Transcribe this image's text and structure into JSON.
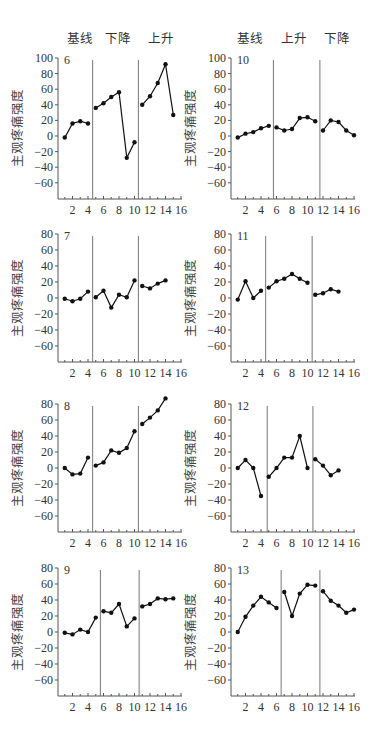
{
  "figure": {
    "left_phase_headers": [
      "基线",
      "下降",
      "上升"
    ],
    "right_phase_headers": [
      "基线",
      "上升",
      "下降"
    ],
    "y_axis_label": "主观疼痛强度",
    "x_tick_labels": [
      "2",
      "4",
      "6",
      "8",
      "10",
      "12",
      "14",
      "16"
    ]
  },
  "chart_data": [
    {
      "type": "line",
      "panel": "6",
      "column": "left",
      "row": 0,
      "title": "6",
      "ylabel": "主观疼痛强度",
      "xlabel": "",
      "phases": [
        "基线",
        "下降",
        "上升"
      ],
      "phase_change_x": [
        4.6,
        10.5
      ],
      "ylim": [
        -60,
        100
      ],
      "yticks": [
        100,
        80,
        60,
        40,
        20,
        0,
        -20,
        -40,
        -60
      ],
      "xlim": [
        0,
        16
      ],
      "xticks": [
        2,
        4,
        6,
        8,
        10,
        12,
        14,
        16
      ],
      "grid": false,
      "segments": [
        {
          "x": [
            1,
            2,
            3,
            4
          ],
          "y": [
            -2,
            16,
            19,
            16
          ]
        },
        {
          "x": [
            5,
            6,
            7,
            8,
            9,
            10
          ],
          "y": [
            36,
            42,
            50,
            56,
            -28,
            -8
          ]
        },
        {
          "x": [
            11,
            12,
            13,
            14,
            15
          ],
          "y": [
            40,
            51,
            68,
            92,
            27
          ]
        }
      ]
    },
    {
      "type": "line",
      "panel": "10",
      "column": "right",
      "row": 0,
      "title": "10",
      "ylabel": "主观疼痛强度",
      "xlabel": "",
      "phases": [
        "基线",
        "上升",
        "下降"
      ],
      "phase_change_x": [
        5.6,
        11.6
      ],
      "ylim": [
        -60,
        100
      ],
      "yticks": [
        100,
        80,
        60,
        40,
        20,
        0,
        -20,
        -40,
        -60
      ],
      "xlim": [
        0,
        16
      ],
      "xticks": [
        2,
        4,
        6,
        8,
        10,
        12,
        14,
        16
      ],
      "grid": false,
      "segments": [
        {
          "x": [
            1,
            2,
            3,
            4,
            5
          ],
          "y": [
            -2,
            3,
            5,
            10,
            13
          ]
        },
        {
          "x": [
            6,
            7,
            8,
            9,
            10,
            11
          ],
          "y": [
            11,
            7,
            9,
            23,
            24,
            19
          ]
        },
        {
          "x": [
            12,
            13,
            14,
            15,
            16
          ],
          "y": [
            7,
            20,
            18,
            7,
            1
          ]
        }
      ]
    },
    {
      "type": "line",
      "panel": "7",
      "column": "left",
      "row": 1,
      "title": "7",
      "ylabel": "主观疼痛强度",
      "xlabel": "",
      "phases": [
        "基线",
        "下降",
        "上升"
      ],
      "phase_change_x": [
        4.6,
        10.5
      ],
      "ylim": [
        -80,
        80
      ],
      "yticks": [
        80,
        60,
        40,
        20,
        0,
        -20,
        -40,
        -60
      ],
      "xlim": [
        0,
        16
      ],
      "xticks": [
        2,
        4,
        6,
        8,
        10,
        12,
        14,
        16
      ],
      "grid": false,
      "segments": [
        {
          "x": [
            1,
            2,
            3,
            4
          ],
          "y": [
            -1,
            -4,
            -1,
            8
          ]
        },
        {
          "x": [
            5,
            6,
            7,
            8,
            9,
            10
          ],
          "y": [
            1,
            9,
            -12,
            4,
            1,
            22
          ]
        },
        {
          "x": [
            11,
            12,
            13,
            14
          ],
          "y": [
            15,
            12,
            18,
            22
          ]
        }
      ]
    },
    {
      "type": "line",
      "panel": "11",
      "column": "right",
      "row": 1,
      "title": "11",
      "ylabel": "主观疼痛强度",
      "xlabel": "",
      "phases": [
        "基线",
        "上升",
        "下降"
      ],
      "phase_change_x": [
        4.6,
        10.6
      ],
      "ylim": [
        -80,
        80
      ],
      "yticks": [
        80,
        60,
        40,
        20,
        0,
        -20,
        -40,
        -60
      ],
      "xlim": [
        0,
        16
      ],
      "xticks": [
        2,
        4,
        6,
        8,
        10,
        12,
        14,
        16
      ],
      "grid": false,
      "segments": [
        {
          "x": [
            1,
            2,
            3,
            4
          ],
          "y": [
            -2,
            21,
            0,
            9
          ]
        },
        {
          "x": [
            5,
            6,
            7,
            8,
            9,
            10
          ],
          "y": [
            13,
            21,
            24,
            30,
            24,
            19
          ]
        },
        {
          "x": [
            11,
            12,
            13,
            14
          ],
          "y": [
            4,
            6,
            11,
            8
          ]
        }
      ]
    },
    {
      "type": "line",
      "panel": "8",
      "column": "left",
      "row": 2,
      "title": "8",
      "ylabel": "主观疼痛强度",
      "xlabel": "",
      "phases": [
        "基线",
        "下降",
        "上升"
      ],
      "phase_change_x": [
        4.6,
        10.5
      ],
      "ylim": [
        -80,
        80
      ],
      "yticks": [
        80,
        60,
        40,
        20,
        0,
        -20,
        -40,
        -60
      ],
      "xlim": [
        0,
        16
      ],
      "xticks": [
        2,
        4,
        6,
        8,
        10,
        12,
        14,
        16
      ],
      "grid": false,
      "segments": [
        {
          "x": [
            1,
            2,
            3,
            4
          ],
          "y": [
            0,
            -8,
            -7,
            13
          ]
        },
        {
          "x": [
            5,
            6,
            7,
            8,
            9,
            10
          ],
          "y": [
            3,
            7,
            22,
            19,
            25,
            46
          ]
        },
        {
          "x": [
            11,
            12,
            13,
            14
          ],
          "y": [
            55,
            63,
            72,
            87
          ]
        }
      ]
    },
    {
      "type": "line",
      "panel": "12",
      "column": "right",
      "row": 2,
      "title": "12",
      "ylabel": "主观疼痛强度",
      "xlabel": "",
      "phases": [
        "基线",
        "上升",
        "下降"
      ],
      "phase_change_x": [
        4.8,
        10.7
      ],
      "ylim": [
        -80,
        80
      ],
      "yticks": [
        80,
        60,
        40,
        20,
        0,
        -20,
        -40,
        -60
      ],
      "xlim": [
        0,
        16
      ],
      "xticks": [
        2,
        4,
        6,
        8,
        10,
        12,
        14,
        16
      ],
      "grid": false,
      "segments": [
        {
          "x": [
            1,
            2,
            3,
            4
          ],
          "y": [
            0,
            10,
            0,
            -35
          ]
        },
        {
          "x": [
            5,
            6,
            7,
            8,
            9,
            10
          ],
          "y": [
            -11,
            0,
            13,
            13,
            40,
            0
          ]
        },
        {
          "x": [
            11,
            12,
            13,
            14
          ],
          "y": [
            11,
            3,
            -9,
            -3
          ]
        }
      ]
    },
    {
      "type": "line",
      "panel": "9",
      "column": "left",
      "row": 3,
      "title": "9",
      "ylabel": "主观疼痛强度",
      "xlabel": "",
      "phases": [
        "基线",
        "下降",
        "上升"
      ],
      "phase_change_x": [
        5.6,
        10.6
      ],
      "ylim": [
        -80,
        80
      ],
      "yticks": [
        80,
        60,
        40,
        20,
        0,
        -20,
        -40,
        -60
      ],
      "xlim": [
        0,
        16
      ],
      "xticks": [
        2,
        4,
        6,
        8,
        10,
        12,
        14,
        16
      ],
      "grid": false,
      "segments": [
        {
          "x": [
            1,
            2,
            3,
            4,
            5
          ],
          "y": [
            -1,
            -3,
            3,
            0,
            18
          ]
        },
        {
          "x": [
            6,
            7,
            8,
            9,
            10
          ],
          "y": [
            26,
            24,
            35,
            7,
            17
          ]
        },
        {
          "x": [
            11,
            12,
            13,
            14,
            15
          ],
          "y": [
            32,
            35,
            42,
            41,
            42
          ]
        }
      ]
    },
    {
      "type": "line",
      "panel": "13",
      "column": "right",
      "row": 3,
      "title": "13",
      "ylabel": "主观疼痛强度",
      "xlabel": "",
      "phases": [
        "基线",
        "上升",
        "下降"
      ],
      "phase_change_x": [
        6.6,
        11.6
      ],
      "ylim": [
        -80,
        80
      ],
      "yticks": [
        80,
        60,
        40,
        20,
        0,
        -20,
        -40,
        -60
      ],
      "xlim": [
        0,
        16
      ],
      "xticks": [
        2,
        4,
        6,
        8,
        10,
        12,
        14,
        16
      ],
      "grid": false,
      "segments": [
        {
          "x": [
            1,
            2,
            3,
            4,
            5,
            6
          ],
          "y": [
            0,
            19,
            33,
            44,
            37,
            30
          ]
        },
        {
          "x": [
            7,
            8,
            9,
            10,
            11
          ],
          "y": [
            50,
            20,
            48,
            59,
            58
          ]
        },
        {
          "x": [
            12,
            13,
            14,
            15,
            16
          ],
          "y": [
            51,
            39,
            33,
            24,
            28
          ]
        }
      ]
    }
  ]
}
